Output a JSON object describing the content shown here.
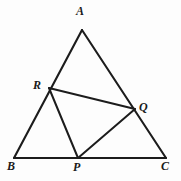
{
  "figure": {
    "type": "geometry-diagram",
    "background_color": "#fdfdfd",
    "stroke_color": "#1c1c1c",
    "label_color": "#1a1a1a"
  },
  "points": {
    "A": {
      "label": "A",
      "x": 82,
      "y": 30,
      "label_x": 76,
      "label_y": 5
    },
    "B": {
      "label": "B",
      "x": 14,
      "y": 158,
      "label_x": 7,
      "label_y": 160
    },
    "C": {
      "label": "C",
      "x": 166,
      "y": 158,
      "label_x": 161,
      "label_y": 160
    },
    "P": {
      "label": "P",
      "x": 78,
      "y": 158,
      "label_x": 73,
      "label_y": 161
    },
    "Q": {
      "label": "Q",
      "x": 135,
      "y": 109,
      "label_x": 139,
      "label_y": 101
    },
    "R": {
      "label": "R",
      "x": 49,
      "y": 88,
      "label_x": 33,
      "label_y": 79
    }
  },
  "segments": [
    {
      "name": "side-AB",
      "from": "A",
      "to": "B",
      "kind": "edge"
    },
    {
      "name": "side-AC",
      "from": "A",
      "to": "C",
      "kind": "edge"
    },
    {
      "name": "side-BC",
      "from": "B",
      "to": "C",
      "kind": "edge"
    },
    {
      "name": "segment-RQ",
      "from": "R",
      "to": "Q",
      "kind": "cevian"
    },
    {
      "name": "segment-RP",
      "from": "R",
      "to": "P",
      "kind": "cevian"
    },
    {
      "name": "segment-PQ",
      "from": "P",
      "to": "Q",
      "kind": "cevian"
    }
  ]
}
